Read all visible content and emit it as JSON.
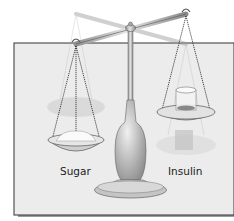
{
  "figure": {
    "labels": {
      "left_pan": "Sugar",
      "right_pan": "Insulin"
    },
    "colors": {
      "panel_bg": "#ececec",
      "panel_border": "#333333",
      "shadow": "#9a9a9a",
      "metal": "#b9b9b9",
      "pan_fill": "#d9d9d9"
    }
  }
}
